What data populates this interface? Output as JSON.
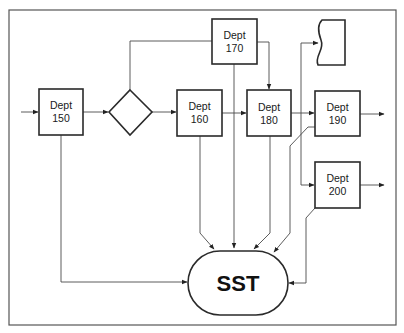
{
  "diagram": {
    "type": "process-flow",
    "nodes": [
      {
        "id": "dept150",
        "shape": "rectangle",
        "line1": "Dept",
        "line2": "150"
      },
      {
        "id": "decision",
        "shape": "diamond",
        "label": ""
      },
      {
        "id": "dept160",
        "shape": "rectangle",
        "line1": "Dept",
        "line2": "160"
      },
      {
        "id": "dept170",
        "shape": "rectangle",
        "line1": "Dept",
        "line2": "170"
      },
      {
        "id": "dept180",
        "shape": "rectangle",
        "line1": "Dept",
        "line2": "180"
      },
      {
        "id": "document",
        "shape": "document",
        "label": ""
      },
      {
        "id": "dept190",
        "shape": "rectangle",
        "line1": "Dept",
        "line2": "190"
      },
      {
        "id": "dept200",
        "shape": "rectangle",
        "line1": "Dept",
        "line2": "200"
      },
      {
        "id": "sst",
        "shape": "terminator",
        "label": "SST"
      }
    ],
    "edges": [
      {
        "from": "input",
        "to": "dept150"
      },
      {
        "from": "dept150",
        "to": "decision"
      },
      {
        "from": "decision",
        "to": "dept160"
      },
      {
        "from": "decision",
        "to": "dept170"
      },
      {
        "from": "dept160",
        "to": "dept180"
      },
      {
        "from": "dept170",
        "to": "dept180"
      },
      {
        "from": "dept180",
        "to": "dept190"
      },
      {
        "from": "dept180",
        "to": "document"
      },
      {
        "from": "dept180",
        "to": "dept200"
      },
      {
        "from": "dept190",
        "to": "output"
      },
      {
        "from": "dept200",
        "to": "output"
      },
      {
        "from": "dept150",
        "to": "sst"
      },
      {
        "from": "dept160",
        "to": "sst"
      },
      {
        "from": "dept170",
        "to": "sst"
      },
      {
        "from": "dept180",
        "to": "sst"
      },
      {
        "from": "dept190",
        "to": "sst"
      },
      {
        "from": "dept200",
        "to": "sst"
      }
    ]
  }
}
